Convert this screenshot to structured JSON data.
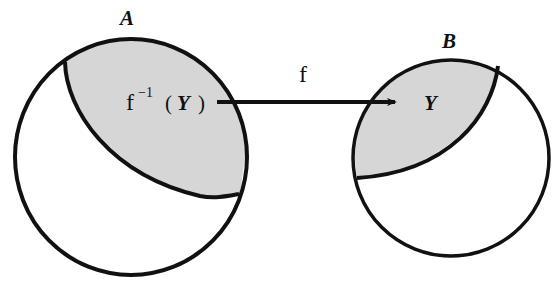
{
  "diagram": {
    "type": "function-preimage-venn",
    "colors": {
      "stroke": "#111111",
      "shade": "#d6d6d6",
      "background": "#ffffff"
    },
    "sets": [
      {
        "id": "A",
        "label": "A",
        "role": "domain"
      },
      {
        "id": "B",
        "label": "B",
        "role": "codomain"
      }
    ],
    "regions": [
      {
        "id": "preimage",
        "in_set": "A",
        "label_func": "f",
        "label_exp": "−1",
        "label_open": "(",
        "label_arg": "Y",
        "label_close": ")",
        "shaded": true
      },
      {
        "id": "Y",
        "in_set": "B",
        "label": "Y",
        "shaded": true
      }
    ],
    "arrow": {
      "label": "f",
      "from": "preimage",
      "to": "Y"
    }
  }
}
